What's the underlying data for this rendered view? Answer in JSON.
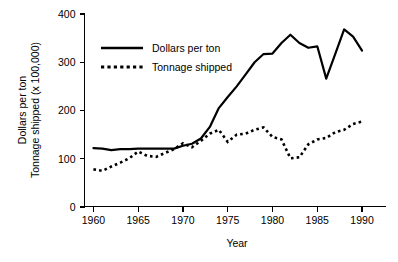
{
  "chart_data": {
    "type": "line",
    "title": "",
    "subtitle": "",
    "xlabel": "Year",
    "ylabel": "Dollars per ton\nTonnage shipped (x 100,000)",
    "ylabel_line1": "Dollars per ton",
    "ylabel_line2": "Tonnage shipped (x 100,000)",
    "xlim": [
      1959,
      1991
    ],
    "ylim": [
      0,
      400
    ],
    "xticks": [
      1960,
      1965,
      1970,
      1975,
      1980,
      1985,
      1990
    ],
    "xtick_labels": [
      "1960",
      "1965",
      "1970",
      "1975",
      "1980",
      "1985",
      "1990"
    ],
    "yticks": [
      0,
      100,
      200,
      300,
      400
    ],
    "ytick_labels": [
      "0",
      "100",
      "200",
      "300",
      "400"
    ],
    "grid": false,
    "legend_position": "upper-left-inside",
    "x": [
      1960,
      1961,
      1962,
      1963,
      1964,
      1965,
      1966,
      1967,
      1968,
      1969,
      1970,
      1971,
      1972,
      1973,
      1974,
      1975,
      1976,
      1977,
      1978,
      1979,
      1980,
      1981,
      1982,
      1983,
      1984,
      1985,
      1986,
      1987,
      1988,
      1989,
      1990
    ],
    "series": [
      {
        "name": "Dollars per ton",
        "style": "solid",
        "color": "#000000",
        "values": [
          122,
          121,
          118,
          120,
          120,
          121,
          121,
          121,
          121,
          121,
          127,
          131,
          142,
          166,
          205,
          228,
          250,
          275,
          300,
          317,
          318,
          340,
          357,
          340,
          330,
          333,
          266,
          317,
          368,
          353,
          324
        ]
      },
      {
        "name": "Tonnage shipped",
        "style": "dotted",
        "color": "#000000",
        "values": [
          78,
          75,
          84,
          92,
          101,
          115,
          106,
          104,
          112,
          120,
          132,
          124,
          137,
          152,
          160,
          135,
          150,
          152,
          160,
          165,
          145,
          140,
          101,
          103,
          130,
          140,
          143,
          155,
          160,
          172,
          177
        ]
      }
    ],
    "legend": [
      {
        "label": "Dollars per ton",
        "style": "solid"
      },
      {
        "label": "Tonnage shipped",
        "style": "dotted"
      }
    ]
  }
}
